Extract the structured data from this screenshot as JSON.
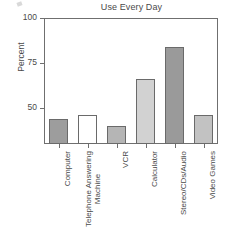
{
  "chart_data": {
    "type": "bar",
    "title": "Use Every Day",
    "xlabel": "",
    "ylabel": "Percent",
    "categories": [
      "Computer",
      "Telephone Answering Machine",
      "VCR",
      "Calculator",
      "Stereo/CDs/Audio",
      "Video Games"
    ],
    "values": [
      44,
      46,
      40,
      66,
      84,
      46
    ],
    "ylim": [
      30,
      100
    ],
    "ytick_labels": [
      "100",
      "75",
      "50"
    ],
    "ytick_values": [
      100,
      75,
      50
    ],
    "grid": false,
    "legend": null,
    "bar_colors": [
      "#9d9d9d",
      "#ffffff",
      "#b5b5b5",
      "#d2d2d2",
      "#9a9a9a",
      "#c2c2c2"
    ],
    "axis_color": "#6f6f6f",
    "text_color": "#4a4a4a"
  },
  "axis": {
    "y_title": "Percent",
    "ticks": [
      {
        "label": "100",
        "value": 100
      },
      {
        "label": "75",
        "value": 75
      },
      {
        "label": "50",
        "value": 50
      }
    ]
  },
  "x_labels": [
    {
      "line1": "Computer",
      "line2": ""
    },
    {
      "line1": "Telephone Answering",
      "line2": "Machine"
    },
    {
      "line1": "VCR",
      "line2": ""
    },
    {
      "line1": "Calculator",
      "line2": ""
    },
    {
      "line1": "Stereo/CDs/Audio",
      "line2": ""
    },
    {
      "line1": "Video Games",
      "line2": ""
    }
  ]
}
